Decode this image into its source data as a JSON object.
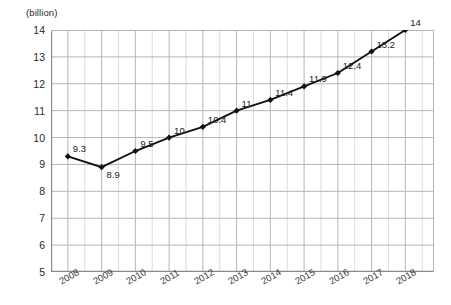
{
  "chart_data": {
    "type": "line",
    "title": "",
    "subtitle": "",
    "xlabel": "",
    "ylabel": "",
    "unit_label": "(billion)",
    "categories": [
      "2008",
      "2009",
      "2010",
      "2011",
      "2012",
      "2013",
      "2014",
      "2015",
      "2016",
      "2017",
      "2018"
    ],
    "values": [
      9.3,
      8.9,
      9.5,
      10,
      10.4,
      11,
      11.4,
      11.9,
      12.4,
      13.2,
      14
    ],
    "point_labels": [
      "9.3",
      "8.9",
      "9.5",
      "10",
      "10.4",
      "11",
      "11.4",
      "11.9",
      "12.4",
      "13.2",
      "14"
    ],
    "ylim": [
      5,
      14
    ],
    "ytick_labels": [
      "14",
      "13",
      "12",
      "11",
      "10",
      "9",
      "8",
      "7",
      "6",
      "5"
    ],
    "ytick_values": [
      14,
      13,
      12,
      11,
      10,
      9,
      8,
      7,
      6,
      5
    ],
    "ystep": 1,
    "grid": true,
    "minor_vertical_grid": true,
    "legend": "none",
    "series_color": "#111111",
    "marker": "diamond",
    "grid_color": "#b6b6b6",
    "minor_grid_color": "#dcdcdc",
    "axis_color": "#8a8a8a"
  }
}
